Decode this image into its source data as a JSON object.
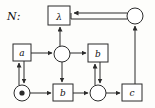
{
  "figure": {
    "label": "N:",
    "type": "petri-net-diagram",
    "stroke_color": "#2b2b2b",
    "fill_color": "#ffffff",
    "background": "#fdfdfb"
  },
  "nodes": {
    "transitions": [
      {
        "id": "t-lambda",
        "label": "λ",
        "shape": "box",
        "x": 48,
        "y": 6,
        "w": 22,
        "h": 19
      },
      {
        "id": "t-a",
        "label": "a",
        "shape": "box",
        "x": 13,
        "y": 44,
        "w": 18,
        "h": 17
      },
      {
        "id": "t-b-upper",
        "label": "b",
        "shape": "box",
        "x": 88,
        "y": 44,
        "w": 20,
        "h": 18
      },
      {
        "id": "t-b-lower",
        "label": "b",
        "shape": "box",
        "x": 53,
        "y": 84,
        "w": 20,
        "h": 17
      },
      {
        "id": "t-c",
        "label": "c",
        "shape": "box",
        "x": 122,
        "y": 84,
        "w": 20,
        "h": 17
      }
    ],
    "places": [
      {
        "id": "p-top-right",
        "label": "",
        "shape": "circle",
        "cx": 135,
        "cy": 16,
        "r": 8,
        "marked": false
      },
      {
        "id": "p-middle",
        "label": "",
        "shape": "circle",
        "cx": 62,
        "cy": 54,
        "r": 8,
        "marked": false
      },
      {
        "id": "p-bottom-left",
        "label": "",
        "shape": "circle",
        "cx": 22,
        "cy": 93,
        "r": 8,
        "marked": true
      },
      {
        "id": "p-bottom-mid",
        "label": "",
        "shape": "circle",
        "cx": 98,
        "cy": 93,
        "r": 8,
        "marked": false
      }
    ]
  },
  "arcs": [
    {
      "id": "arc-topright-to-lambda",
      "from": "p-top-right",
      "to": "t-lambda",
      "style": "double",
      "direction": "left"
    },
    {
      "id": "arc-c-to-topright",
      "from": "t-c",
      "to": "p-top-right",
      "style": "single",
      "direction": "up"
    },
    {
      "id": "arc-middle-to-lambda",
      "from": "p-middle",
      "to": "t-lambda",
      "style": "single",
      "direction": "up"
    },
    {
      "id": "arc-a-to-middle",
      "from": "t-a",
      "to": "p-middle",
      "style": "single",
      "direction": "right"
    },
    {
      "id": "arc-middle-to-bupper",
      "from": "p-middle",
      "to": "t-b-upper",
      "style": "single",
      "direction": "right"
    },
    {
      "id": "arc-middle-to-blower",
      "from": "p-middle",
      "to": "t-b-lower",
      "style": "single",
      "direction": "down"
    },
    {
      "id": "arc-a-bottomleft-double",
      "from": "t-a",
      "to": "p-bottom-left",
      "style": "double",
      "direction": "both-vertical"
    },
    {
      "id": "arc-bupper-bottommid-double",
      "from": "t-b-upper",
      "to": "p-bottom-mid",
      "style": "double",
      "direction": "both-vertical"
    },
    {
      "id": "arc-bottomleft-to-blower",
      "from": "p-bottom-left",
      "to": "t-b-lower",
      "style": "single",
      "direction": "right"
    },
    {
      "id": "arc-blower-to-bottommid",
      "from": "t-b-lower",
      "to": "p-bottom-mid",
      "style": "single",
      "direction": "right"
    },
    {
      "id": "arc-bottommid-to-c",
      "from": "p-bottom-mid",
      "to": "t-c",
      "style": "single",
      "direction": "right"
    }
  ]
}
